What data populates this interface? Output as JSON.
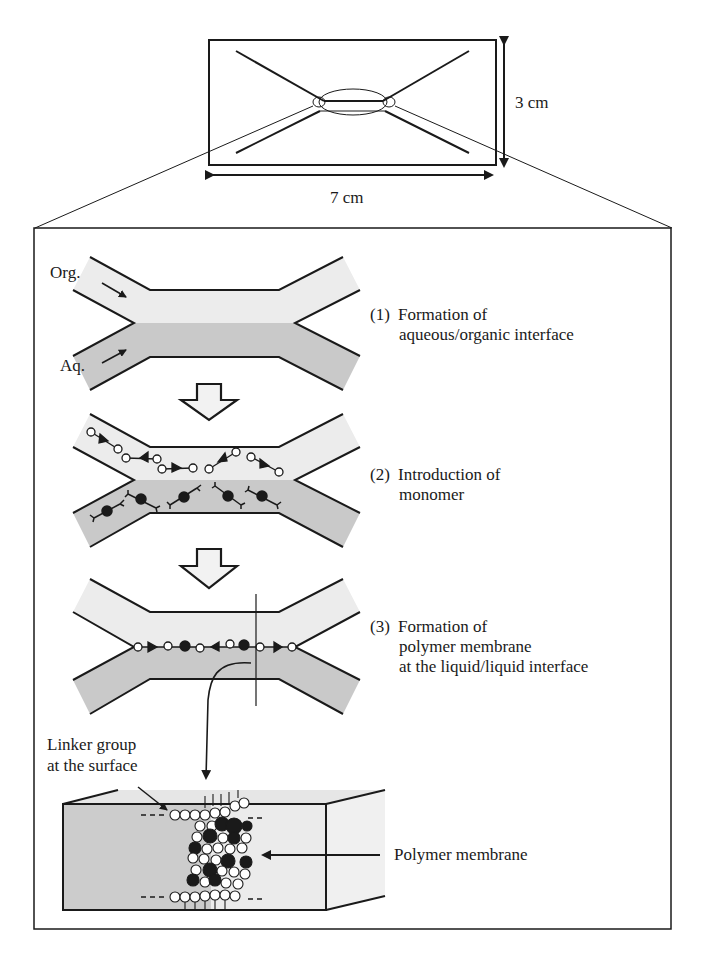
{
  "figure": {
    "chip": {
      "width_label": "7 cm",
      "height_label": "3 cm"
    },
    "channel_labels": {
      "organic": "Org.",
      "aqueous": "Aq."
    },
    "steps": [
      {
        "number": "(1)",
        "line1": "Formation of",
        "line2": "aqueous/organic interface",
        "line3": ""
      },
      {
        "number": "(2)",
        "line1": "Introduction of",
        "line2": "monomer",
        "line3": ""
      },
      {
        "number": "(3)",
        "line1": "Formation of",
        "line2": "polymer membrane",
        "line3": "at the liquid/liquid interface"
      }
    ],
    "detail": {
      "linker_label_line1": "Linker group",
      "linker_label_line2": "at the surface",
      "membrane_label": "Polymer membrane"
    },
    "colors": {
      "organic_phase": "#ececec",
      "aqueous_phase": "#c9c9c9",
      "outline": "#1a1a1a",
      "background": "#ffffff"
    }
  }
}
